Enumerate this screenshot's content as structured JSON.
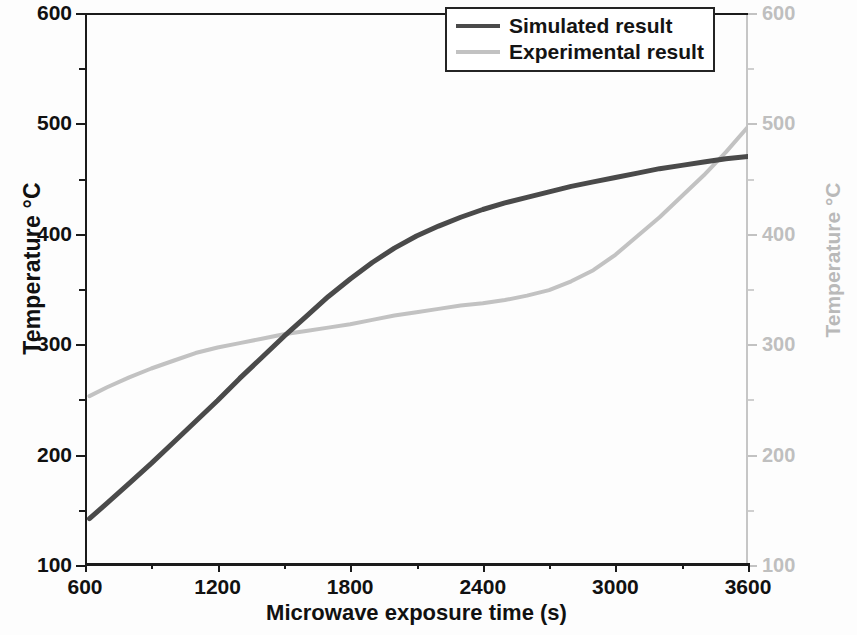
{
  "chart_data": {
    "type": "line",
    "title": "",
    "xlabel": "Microwave exposure time (s)",
    "ylabel": "Temperature °C",
    "ylabel_right": "Temperature °C",
    "xlim": [
      600,
      3600
    ],
    "ylim": [
      100,
      600
    ],
    "ylim_right": [
      100,
      600
    ],
    "xticks": [
      600,
      1200,
      1800,
      2400,
      3000,
      3600
    ],
    "xtick_labels": [
      "600",
      "1200",
      "1800",
      "2400",
      "3000",
      "3600"
    ],
    "yticks": [
      100,
      200,
      300,
      400,
      500,
      600
    ],
    "ytick_labels": [
      "100",
      "200",
      "300",
      "400",
      "500",
      "600"
    ],
    "yticks_right": [
      100,
      200,
      300,
      400,
      500,
      600
    ],
    "ytick_labels_right": [
      "100",
      "200",
      "300",
      "400",
      "500",
      "600"
    ],
    "yticks_minor": [
      150,
      250,
      350,
      450,
      550
    ],
    "xticks_minor": [
      900,
      1500,
      2100,
      2700,
      3300
    ],
    "grid": false,
    "legend_position": "top-right",
    "colors": {
      "simulated": "#4a4a4a",
      "experimental": "#c2c2c2",
      "axis": "#1b1b1b",
      "right_axis": "#c2c2c2",
      "background": "#fdfdfd"
    },
    "annotations": [
      "Curves cross at approximately t = 1350 s, T = 302 °C",
      "Curves cross again at approximately t = 3465 s, T = 469 °C"
    ],
    "series": [
      {
        "name": "Simulated result",
        "color": "#4a4a4a",
        "x": [
          620,
          700,
          800,
          900,
          1000,
          1100,
          1200,
          1300,
          1400,
          1500,
          1600,
          1700,
          1800,
          1900,
          2000,
          2100,
          2200,
          2300,
          2400,
          2500,
          2600,
          2700,
          2800,
          2900,
          3000,
          3100,
          3200,
          3300,
          3400,
          3500,
          3600
        ],
        "y": [
          142,
          156,
          174,
          192,
          211,
          230,
          249,
          269,
          288,
          307,
          325,
          343,
          359,
          374,
          387,
          398,
          407,
          415,
          422,
          428,
          433,
          438,
          443,
          447,
          451,
          455,
          459,
          462,
          465,
          468,
          470
        ]
      },
      {
        "name": "Experimental result",
        "color": "#c2c2c2",
        "x": [
          620,
          700,
          800,
          900,
          1000,
          1100,
          1200,
          1300,
          1400,
          1500,
          1600,
          1700,
          1800,
          1900,
          2000,
          2100,
          2200,
          2300,
          2400,
          2500,
          2600,
          2700,
          2800,
          2900,
          3000,
          3100,
          3200,
          3300,
          3400,
          3500,
          3600
        ],
        "y": [
          253,
          261,
          270,
          278,
          285,
          292,
          297,
          301,
          305,
          309,
          312,
          315,
          318,
          322,
          326,
          329,
          332,
          335,
          337,
          340,
          344,
          349,
          357,
          367,
          381,
          398,
          415,
          434,
          453,
          474,
          497
        ]
      }
    ]
  },
  "legend": {
    "items": [
      {
        "label": "Simulated result",
        "color": "#4a4a4a"
      },
      {
        "label": "Experimental result",
        "color": "#c2c2c2"
      }
    ]
  }
}
